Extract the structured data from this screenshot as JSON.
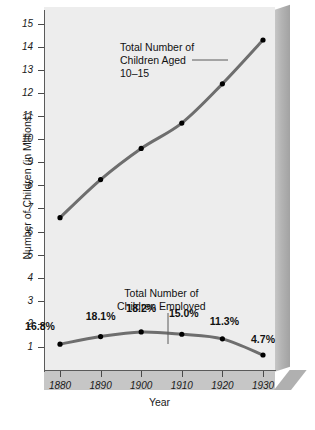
{
  "chart_data": {
    "type": "line",
    "title": "",
    "xlabel": "Year",
    "ylabel": "Number of Children (in Millions)",
    "x": [
      1880,
      1890,
      1900,
      1910,
      1920,
      1930
    ],
    "xtick_labels": [
      "1880",
      "1890",
      "1900",
      "1910",
      "1920",
      "1930"
    ],
    "ytick_labels": [
      "1",
      "2",
      "3",
      "4",
      "5",
      "6",
      "7",
      "8",
      "9",
      "10",
      "11",
      "12",
      "13",
      "14",
      "15"
    ],
    "ylim": [
      0,
      15
    ],
    "xlim": [
      1875,
      1935
    ],
    "grid": false,
    "legend_position": "none",
    "series": [
      {
        "name": "Total Number of Children Aged 10-15",
        "values": [
          6.6,
          8.25,
          9.6,
          10.7,
          12.4,
          14.3
        ],
        "color": "#6e6e6e",
        "marker": "circle",
        "marker_color": "#000000"
      },
      {
        "name": "Total Number of Children Employed",
        "values": [
          1.12,
          1.45,
          1.65,
          1.55,
          1.35,
          0.65
        ],
        "color": "#6e6e6e",
        "marker": "circle",
        "marker_color": "#000000",
        "point_labels": [
          "16.8%",
          "18.1%",
          "18.2%",
          "15.0%",
          "11.3%",
          "4.7%"
        ]
      }
    ],
    "annotations": [
      {
        "id": "upper-annotation",
        "text": "Total Number of\nChildren Aged\n10–15",
        "leader": "horizontal"
      },
      {
        "id": "lower-annotation",
        "text": "Total Number of\nChildren Employed",
        "leader": "vertical"
      }
    ]
  },
  "colors": {
    "panel_background": "#ededed",
    "page_background": "#ffffff",
    "line": "#6e6e6e",
    "marker": "#000000",
    "axis": "#5a5a5a",
    "text": "#111111",
    "block_side": "#b4b4b4",
    "block_bottom": "#c6c6c6"
  }
}
